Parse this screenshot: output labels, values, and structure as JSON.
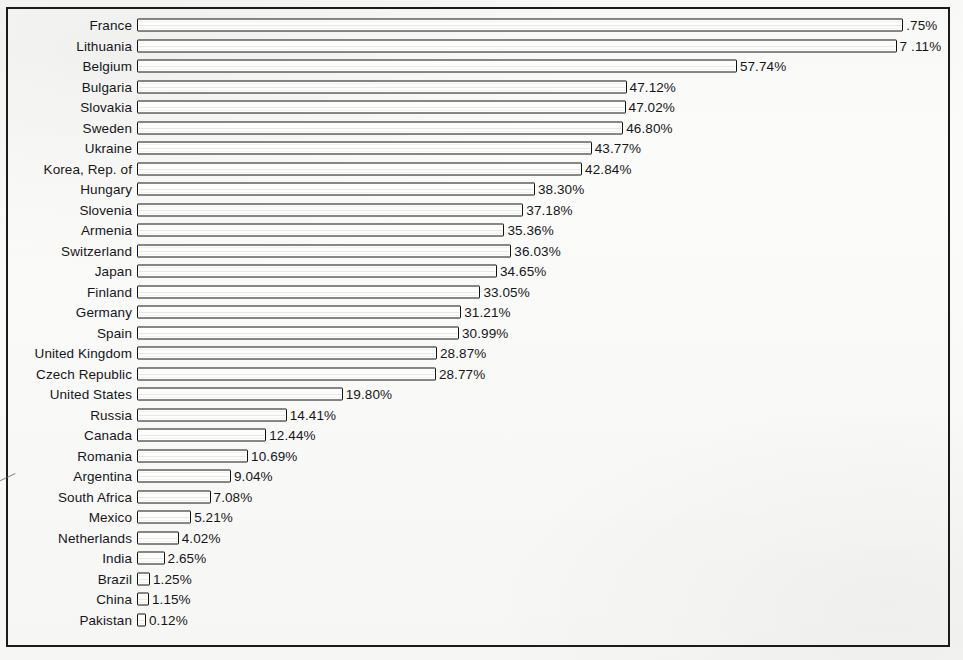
{
  "chart_data": {
    "type": "bar",
    "orientation": "horizontal",
    "title": "",
    "subtitle": "",
    "xlabel": "",
    "ylabel": "",
    "grid": false,
    "legend": null,
    "axis_visible": false,
    "value_suffix": "%",
    "xlim": [
      0,
      80
    ],
    "note": "Labels for the two longest bars are clipped by the figure frame in the scan.",
    "categories": [
      "France",
      "Lithuania",
      "Belgium",
      "Bulgaria",
      "Slovakia",
      "Sweden",
      "Ukraine",
      "Korea, Rep. of",
      "Hungary",
      "Slovenia",
      "Armenia",
      "Switzerland",
      "Japan",
      "Finland",
      "Germany",
      "Spain",
      "United Kingdom",
      "Czech Republic",
      "United States",
      "Russia",
      "Canada",
      "Romania",
      "Argentina",
      "South Africa",
      "Mexico",
      "Netherlands",
      "India",
      "Brazil",
      "China",
      "Pakistan"
    ],
    "values": [
      73.75,
      73.11,
      57.74,
      47.12,
      47.02,
      46.8,
      43.77,
      42.84,
      38.3,
      37.18,
      35.36,
      36.03,
      34.65,
      33.05,
      31.21,
      30.99,
      28.87,
      28.77,
      19.8,
      14.41,
      12.44,
      10.69,
      9.04,
      7.08,
      5.21,
      4.02,
      2.65,
      1.25,
      1.15,
      0.12
    ],
    "value_labels": [
      ".75%",
      "7 .11%",
      "57.74%",
      "47.12%",
      "47.02%",
      "46.80%",
      "43.77%",
      "42.84%",
      "38.30%",
      "37.18%",
      "35.36%",
      "36.03%",
      "34.65%",
      "33.05%",
      "31.21%",
      "30.99%",
      "28.87%",
      "28.77%",
      "19.80%",
      "14.41%",
      "12.44%",
      "10.69%",
      "9.04%",
      "7.08%",
      "5.21%",
      "4.02%",
      "2.65%",
      "1.25%",
      "1.15%",
      "0.12%"
    ]
  }
}
